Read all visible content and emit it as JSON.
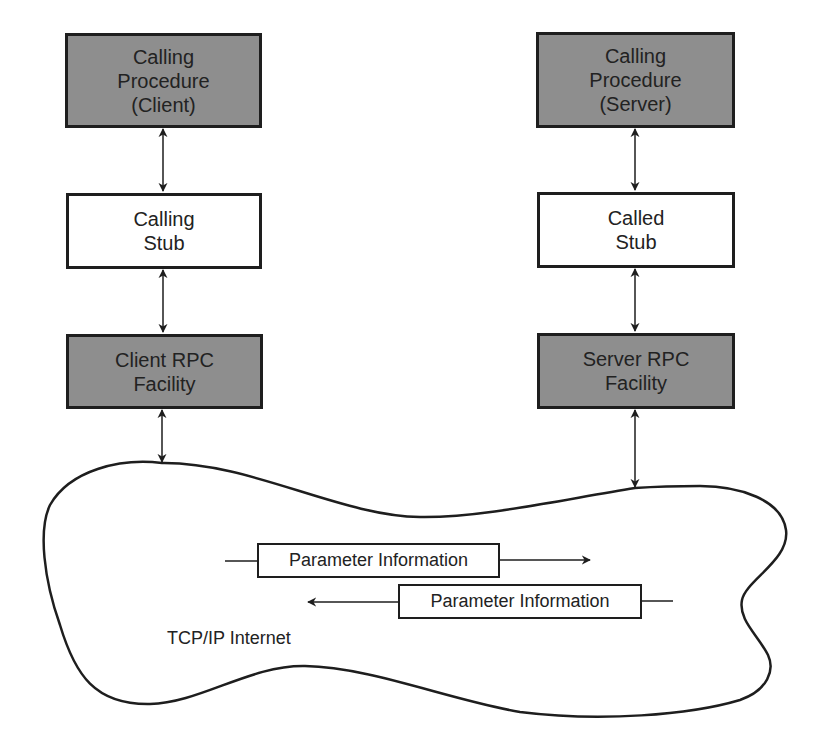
{
  "diagram": {
    "client_column": {
      "calling_procedure": {
        "lines": [
          "Calling",
          "Procedure",
          "(Client)"
        ],
        "fill": "#8e8e8e"
      },
      "stub": {
        "lines": [
          "Calling",
          "Stub"
        ],
        "fill": "#ffffff"
      },
      "rpc_facility": {
        "lines": [
          "Client RPC",
          "Facility"
        ],
        "fill": "#8e8e8e"
      }
    },
    "server_column": {
      "calling_procedure": {
        "lines": [
          "Calling",
          "Procedure",
          "(Server)"
        ],
        "fill": "#8e8e8e"
      },
      "stub": {
        "lines": [
          "Called",
          "Stub"
        ],
        "fill": "#ffffff"
      },
      "rpc_facility": {
        "lines": [
          "Server RPC",
          "Facility"
        ],
        "fill": "#8e8e8e"
      }
    },
    "network": {
      "label": "TCP/IP Internet",
      "messages": [
        {
          "label": "Parameter Information",
          "direction": "right"
        },
        {
          "label": "Parameter Information",
          "direction": "left"
        }
      ]
    },
    "connections": [
      {
        "from": "Calling Procedure (Client)",
        "to": "Calling Stub",
        "type": "bidirectional"
      },
      {
        "from": "Calling Stub",
        "to": "Client RPC Facility",
        "type": "bidirectional"
      },
      {
        "from": "Client RPC Facility",
        "to": "TCP/IP Internet",
        "type": "bidirectional"
      },
      {
        "from": "Calling Procedure (Server)",
        "to": "Called Stub",
        "type": "bidirectional"
      },
      {
        "from": "Called Stub",
        "to": "Server RPC Facility",
        "type": "bidirectional"
      },
      {
        "from": "Server RPC Facility",
        "to": "TCP/IP Internet",
        "type": "bidirectional"
      }
    ],
    "colors": {
      "shaded_box": "#8e8e8e",
      "stroke": "#1e1e1e",
      "background": "#ffffff"
    }
  }
}
